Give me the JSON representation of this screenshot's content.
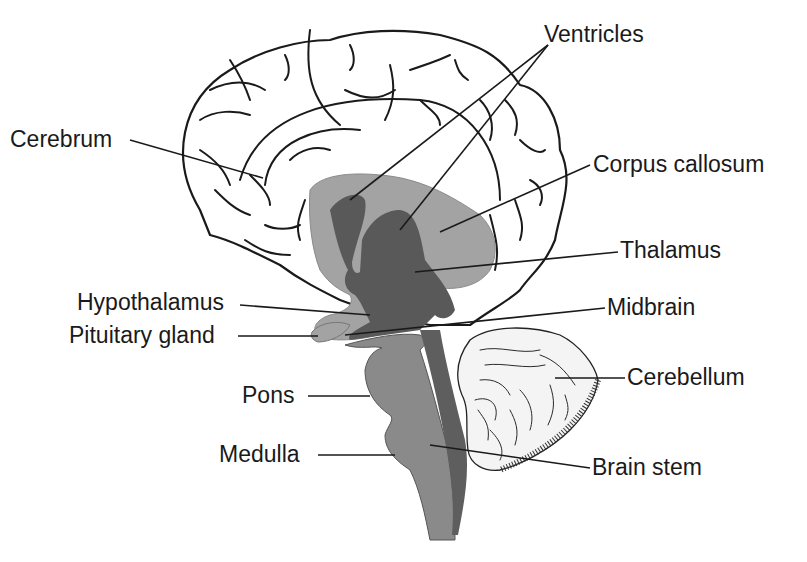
{
  "diagram": {
    "colors": {
      "background": "#ffffff",
      "cerebrum_fill": "#f0f0f0",
      "corpus_callosum_fill": "#a3a3a3",
      "ventricles_thalamus_fill": "#595959",
      "brainstem_fill": "#8a8a8a",
      "brainstem_dark_fill": "#5e5e5e",
      "cerebellum_fill": "#f4f4f4",
      "line": "#1a1a1a"
    },
    "labels": {
      "ventricles": "Ventricles",
      "cerebrum": "Cerebrum",
      "corpus_callosum": "Corpus callosum",
      "thalamus": "Thalamus",
      "hypothalamus": "Hypothalamus",
      "midbrain": "Midbrain",
      "pituitary_gland": "Pituitary gland",
      "cerebellum": "Cerebellum",
      "pons": "Pons",
      "medulla": "Medulla",
      "brain_stem": "Brain stem"
    }
  }
}
